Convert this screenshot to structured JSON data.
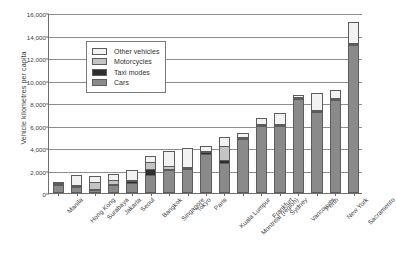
{
  "chart_data": {
    "type": "bar",
    "subtype": "stacked-vertical",
    "title": "",
    "xlabel": "",
    "ylabel": "Vehicle kilometres per capita",
    "ylim": [
      0,
      16000
    ],
    "ytick_step": 2000,
    "yticks": [
      0,
      2000,
      4000,
      6000,
      8000,
      10000,
      12000,
      14000,
      16000
    ],
    "ytick_labels": [
      "0",
      "2,000",
      "4,000",
      "6,000",
      "8,000",
      "10,000",
      "12,000",
      "14,000",
      "16,000"
    ],
    "grid": true,
    "grid_axis": "y",
    "legend_position": "upper-left-inside",
    "categories": [
      "Manila",
      "Hong Kong",
      "Surabaya",
      "Jakarta",
      "Seoul",
      "Bangkok",
      "Singapore",
      "Tokyo",
      "Paris",
      "Kuala Lumpur",
      "Montreal (region)",
      "Frankfurt",
      "Sydney",
      "Vancouver",
      "Perth",
      "New York",
      "Sacramento"
    ],
    "series": [
      {
        "name": "Cars",
        "color": "#8a8a8a",
        "values": [
          700,
          560,
          300,
          680,
          880,
          1600,
          2020,
          2160,
          3480,
          2650,
          4790,
          5930,
          5920,
          8320,
          7180,
          8280,
          13130
        ]
      },
      {
        "name": "Taxi modes",
        "color": "#2e2e2e",
        "values": [
          130,
          60,
          60,
          60,
          180,
          530,
          70,
          90,
          160,
          300,
          60,
          50,
          40,
          40,
          40,
          60,
          60
        ]
      },
      {
        "name": "Motorcycles",
        "color": "#c4c4c4",
        "values": [
          40,
          30,
          620,
          430,
          60,
          630,
          310,
          100,
          110,
          1260,
          60,
          50,
          50,
          50,
          50,
          50,
          50
        ]
      },
      {
        "name": "Other vehicles",
        "color": "#f2f2f2",
        "values": [
          60,
          840,
          530,
          510,
          870,
          520,
          1310,
          1630,
          420,
          760,
          410,
          570,
          1050,
          210,
          1570,
          660,
          1900
        ]
      }
    ],
    "totals": [
      930,
      1490,
      1510,
      1680,
      1990,
      3280,
      3710,
      3980,
      4170,
      4970,
      5320,
      6600,
      7060,
      8620,
      8840,
      9050,
      15140
    ]
  },
  "legend": {
    "entries": [
      {
        "label": "Other vehicles",
        "color": "#f2f2f2"
      },
      {
        "label": "Motorcycles",
        "color": "#c4c4c4"
      },
      {
        "label": "Taxi modes",
        "color": "#2e2e2e"
      },
      {
        "label": "Cars",
        "color": "#8a8a8a"
      }
    ]
  }
}
